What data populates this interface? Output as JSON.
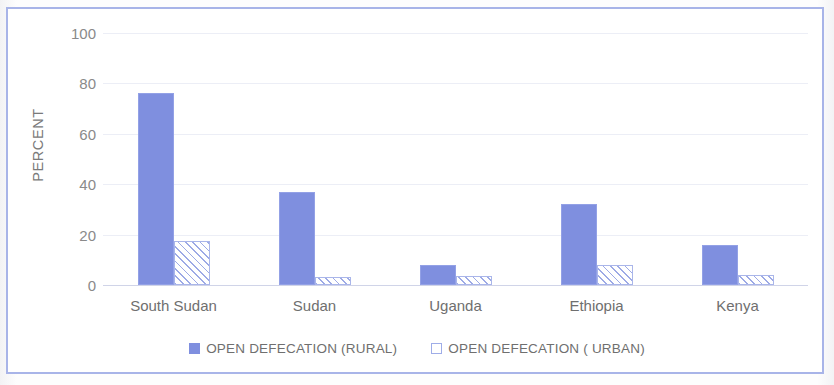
{
  "chart_data": {
    "type": "bar",
    "title": "",
    "subtitle": "",
    "xlabel": "",
    "ylabel": "PERCENT",
    "ylim": [
      0,
      100
    ],
    "ytick_labels": [
      "100",
      "80",
      "60",
      "40",
      "20",
      "0"
    ],
    "ytick_values": [
      100,
      80,
      60,
      40,
      20,
      0
    ],
    "grid": true,
    "legend_position": "bottom",
    "categories": [
      "South Sudan",
      "Sudan",
      "Uganda",
      "Ethiopia",
      "Kenya"
    ],
    "series": [
      {
        "name": "OPEN DEFECATION (RURAL)",
        "color": "#7f8fdf",
        "fill": "solid",
        "values": [
          76,
          37,
          8,
          32,
          16
        ]
      },
      {
        "name": "OPEN DEFECATION ( URBAN)",
        "color": "#ffffff",
        "fill": "diagonal-hatch",
        "values": [
          17.5,
          3,
          3.5,
          8,
          4
        ]
      }
    ]
  },
  "frame": {
    "border_color": "#a8b4e8"
  },
  "legend": {
    "items": [
      {
        "label": "OPEN DEFECATION (RURAL)",
        "marker": "solid-square-swatch"
      },
      {
        "label": "OPEN DEFECATION ( URBAN)",
        "marker": "hollow-square-swatch"
      }
    ]
  }
}
